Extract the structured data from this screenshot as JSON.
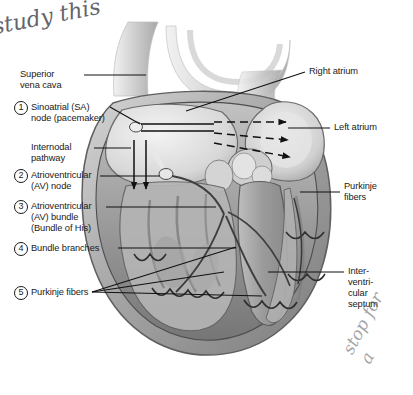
{
  "figure": {
    "background_color": "#ffffff",
    "ink_color": "#1a1a1a"
  },
  "annotations": {
    "top_left_handwriting": "study this",
    "bottom_right_handwriting": "stop for a"
  },
  "left_labels": [
    {
      "number": "",
      "lines": [
        "Superior",
        "vena cava"
      ]
    },
    {
      "number": "1",
      "lines": [
        "Sinoatrial (SA)",
        "node (pacemaker)"
      ]
    },
    {
      "number": "",
      "lines": [
        "Internodal",
        "pathway"
      ]
    },
    {
      "number": "2",
      "lines": [
        "Atrioventricular",
        "(AV) node"
      ]
    },
    {
      "number": "3",
      "lines": [
        "Atrioventricular",
        "(AV) bundle",
        "(Bundle of His)"
      ]
    },
    {
      "number": "4",
      "lines": [
        "Bundle branches"
      ]
    },
    {
      "number": "5",
      "lines": [
        "Purkinje fibers"
      ]
    }
  ],
  "right_labels": [
    {
      "lines": [
        "Right atrium"
      ]
    },
    {
      "lines": [
        "Left atrium"
      ]
    },
    {
      "lines": [
        "Purkinje",
        "fibers"
      ]
    },
    {
      "lines": [
        "Inter-",
        "ventri-",
        "cular",
        "septum"
      ]
    }
  ],
  "conduction_arrows": {
    "internodal_downward": 2,
    "interatrial_dashed_to_left_atrium": 3,
    "description": "Impulse spreads from SA node downward through internodal pathways and rightward across the atria to the left atrium"
  },
  "palette": {
    "myocardium_mid": "#9a9a9a",
    "myocardium_light": "#c9c9c9",
    "myocardium_dark": "#6f6f6f",
    "chamber_pale": "#e2e2e2",
    "vessel_outline": "#555555",
    "handwriting": "#4a4a52"
  }
}
